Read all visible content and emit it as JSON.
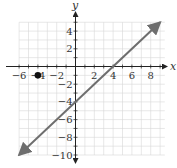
{
  "chart_data": {
    "type": "line",
    "title": "",
    "xlabel": "x",
    "ylabel": "y",
    "xlim": [
      -6,
      9.5
    ],
    "ylim": [
      -10,
      5
    ],
    "grid": true,
    "x_ticks": [
      -6,
      -4,
      -2,
      2,
      4,
      6,
      8
    ],
    "y_ticks": [
      4,
      2,
      -2,
      -4,
      -6,
      -8,
      -10
    ],
    "series": [
      {
        "name": "line",
        "equation": "y = x - 4",
        "x": [
          -6,
          9
        ],
        "y": [
          -10,
          5
        ],
        "arrows": "both",
        "color": "#6e6e6e"
      }
    ],
    "points": [
      {
        "x": -4,
        "y": -1,
        "style": "filled-circle",
        "color": "#111111"
      }
    ],
    "intercepts": {
      "x_intercept": 4,
      "y_intercept": -4
    }
  },
  "axes": {
    "x_label": "x",
    "y_label": "y",
    "x_tick_labels": [
      "−6",
      "−4",
      "−2",
      "2",
      "4",
      "6",
      "8"
    ],
    "y_tick_labels": [
      "4",
      "2",
      "−2",
      "−4",
      "−6",
      "−8",
      "−10"
    ]
  }
}
